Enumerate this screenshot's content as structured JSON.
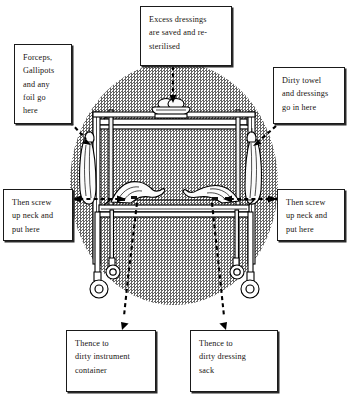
{
  "figure": {
    "background_shape": "halftone-gray-oval",
    "colors": {
      "ink": "#17130f",
      "box_border": "#1a1a1a",
      "paper": "#ffffff",
      "halftone_gray": "#5c5c5c"
    }
  },
  "callouts": [
    {
      "id": "excess-dressings",
      "lines": [
        "Excess dressings",
        "are saved and re-",
        "sterilised"
      ],
      "points_to": "kidney-dish-on-top-shelf",
      "connector": "vertical-dashed-arrow"
    },
    {
      "id": "forceps-gallipots",
      "lines": [
        "Forceps,",
        "Gallipots",
        "and any",
        "foil go",
        "here"
      ],
      "points_to": "left-hanging-bag",
      "connector": "diagonal-dashed-arrow"
    },
    {
      "id": "dirty-towel",
      "lines": [
        "Dirty towel",
        "and dressings",
        "go in here"
      ],
      "points_to": "right-hanging-bag",
      "connector": "diagonal-dashed-arrow"
    },
    {
      "id": "screw-neck-left",
      "lines": [
        "Then screw",
        "up neck and",
        "put here"
      ],
      "points_to": "lower-shelf-left-bag",
      "connector": "horizontal-dashed-arrow"
    },
    {
      "id": "screw-neck-right",
      "lines": [
        "Then screw",
        "up neck and",
        "put here"
      ],
      "points_to": "lower-shelf-right-bag",
      "connector": "horizontal-dashed-arrow"
    },
    {
      "id": "thence-instrument",
      "lines": [
        "Thence to",
        "dirty instrument",
        "container"
      ],
      "points_to": "bottom-left-destination",
      "connector": "diagonal-dashed-arrow"
    },
    {
      "id": "thence-dressing",
      "lines": [
        "Thence to",
        "dirty dressing",
        "sack"
      ],
      "points_to": "bottom-right-destination",
      "connector": "diagonal-dashed-arrow"
    }
  ],
  "illustration": {
    "subject": "two-tier dressing trolley",
    "parts": [
      "top-shelf",
      "lower-shelf",
      "left-upright-rail",
      "right-upright-rail",
      "kidney-dish-with-dressings",
      "left-hanging-disposal-bag",
      "right-hanging-disposal-bag",
      "lower-shelf-left-sealed-bag",
      "lower-shelf-right-sealed-bag",
      "caster-wheel-front-left",
      "caster-wheel-front-right",
      "caster-wheel-rear-left",
      "caster-wheel-rear-right"
    ]
  }
}
